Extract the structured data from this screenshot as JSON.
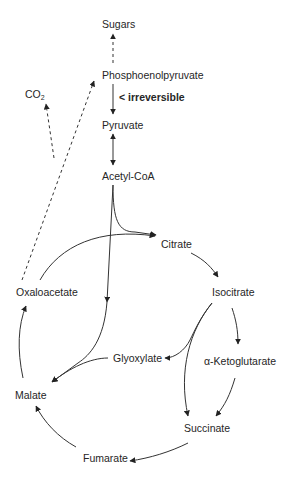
{
  "diagram": {
    "nodes": {
      "sugars": "Sugars",
      "pep": "Phosphoenolpyruvate",
      "irreversible": "< irreversible",
      "co2_base": "CO",
      "co2_sub": "2",
      "pyruvate": "Pyruvate",
      "acetyl_coa": "Acetyl-CoA",
      "citrate": "Citrate",
      "oxaloacetate": "Oxaloacetate",
      "isocitrate": "Isocitrate",
      "glyoxylate": "Glyoxylate",
      "alpha_ketoglutarate": "α-Ketoglutarate",
      "malate": "Malate",
      "succinate": "Succinate",
      "fumarate": "Fumarate"
    },
    "edges": [
      {
        "from": "Phosphoenolpyruvate",
        "to": "Sugars",
        "style": "dashed"
      },
      {
        "from": "Phosphoenolpyruvate",
        "to": "Pyruvate",
        "style": "solid",
        "note": "irreversible"
      },
      {
        "from": "Pyruvate",
        "to": "Acetyl-CoA",
        "style": "solid",
        "bidirectional": true
      },
      {
        "from": "Acetyl-CoA",
        "to": "Citrate",
        "style": "solid"
      },
      {
        "from": "Acetyl-CoA",
        "to": "Malate",
        "style": "solid"
      },
      {
        "from": "Oxaloacetate",
        "to": "Citrate",
        "style": "solid"
      },
      {
        "from": "Citrate",
        "to": "Isocitrate",
        "style": "solid"
      },
      {
        "from": "Isocitrate",
        "to": "α-Ketoglutarate",
        "style": "solid"
      },
      {
        "from": "Isocitrate",
        "to": "Glyoxylate",
        "style": "solid"
      },
      {
        "from": "Isocitrate",
        "to": "Succinate",
        "style": "solid"
      },
      {
        "from": "α-Ketoglutarate",
        "to": "Succinate",
        "style": "solid"
      },
      {
        "from": "Glyoxylate",
        "to": "Malate",
        "style": "solid"
      },
      {
        "from": "Succinate",
        "to": "Fumarate",
        "style": "solid"
      },
      {
        "from": "Fumarate",
        "to": "Malate",
        "style": "solid"
      },
      {
        "from": "Malate",
        "to": "Oxaloacetate",
        "style": "solid"
      },
      {
        "from": "Oxaloacetate",
        "to": "Phosphoenolpyruvate",
        "style": "dashed"
      },
      {
        "from": "Oxaloacetate",
        "to": "CO2",
        "style": "dashed"
      }
    ],
    "colors": {
      "line": "#333333",
      "text": "#262626",
      "background": "#ffffff"
    }
  }
}
